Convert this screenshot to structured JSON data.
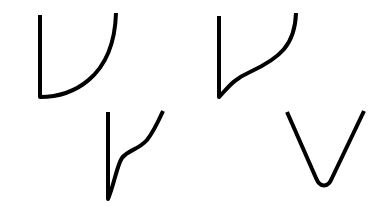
{
  "figure": {
    "background": "#ffffff",
    "stroke_color": "#000000",
    "stroke_width": 4,
    "shapes": [
      {
        "id": "curve-1",
        "description": "vertical line joined to a concave-up arc rising to the right",
        "path": "M40 15 L40 97 C70 97 114 80 116 13"
      },
      {
        "id": "curve-2",
        "description": "vertical line joined to an S-shaped curve rising to the right",
        "path": "M219 16 L219 97 C228 88 232 80 250 72 C280 58 295 45 296 13"
      },
      {
        "id": "curve-3",
        "description": "vertical line joined to a wavy curve rising to the right",
        "path": "M108 112 L108 199 C114 185 117 165 122 158 C128 150 138 150 147 140 C154 131 158 122 163 111"
      },
      {
        "id": "curve-4",
        "description": "rounded V shape",
        "path": "M287 112 L316 178 C320 188 328 188 332 178 L364 111"
      }
    ]
  }
}
